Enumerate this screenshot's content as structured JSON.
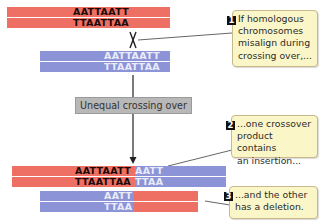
{
  "colors": {
    "red_chromosome": "#ee7064",
    "blue_chromosome": "#8c93d6",
    "callout_bg": "#faf6c8",
    "label_bg": "#b8b8b8"
  },
  "top_chromosome": {
    "color": "red",
    "strand1": "AATTAATT",
    "strand2": "TTAATTAA"
  },
  "bottom_chromosome": {
    "color": "blue",
    "strand1": "AATTAATT",
    "strand2": "TTAATTAA"
  },
  "process_label": "Unequal crossing over",
  "product_insertion": {
    "red_strand1": "AATTAATT",
    "blue_strand1": "AATT",
    "red_strand2": "TTAATTAA",
    "blue_strand2": "TTAA"
  },
  "product_deletion": {
    "blue_strand1": "AATT",
    "blue_strand2": "TTAA"
  },
  "callouts": [
    {
      "number": "1",
      "lines": [
        "If homologous",
        "chromosomes",
        "misalign during",
        "crossing over,..."
      ]
    },
    {
      "number": "2",
      "lines": [
        "...one crossover",
        "product contains",
        "an insertion..."
      ]
    },
    {
      "number": "3",
      "lines": [
        "...and the other",
        "has a deletion."
      ]
    }
  ]
}
